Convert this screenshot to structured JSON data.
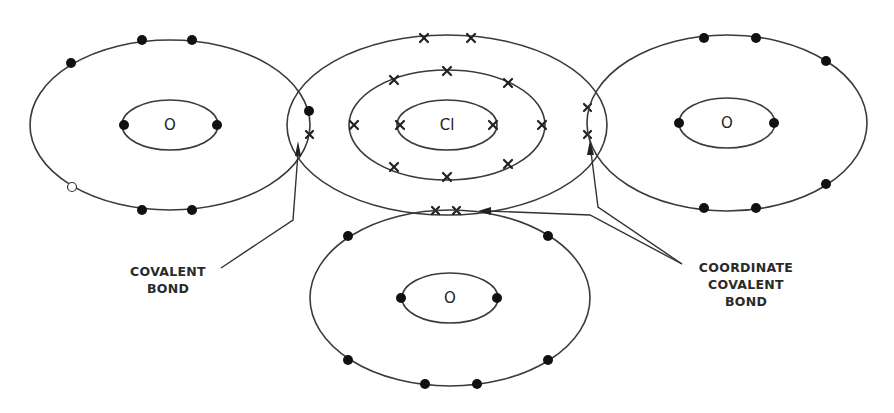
{
  "diagram": {
    "title": "",
    "atoms": [
      {
        "id": "oxygen-left",
        "symbol": "O",
        "cx": 170,
        "cy": 125,
        "shells": [
          [
            48,
            25
          ],
          [
            140,
            85
          ]
        ]
      },
      {
        "id": "chlorine",
        "symbol": "Cl",
        "cx": 447,
        "cy": 125,
        "shells": [
          [
            50,
            25
          ],
          [
            98,
            55
          ],
          [
            160,
            90
          ]
        ]
      },
      {
        "id": "oxygen-right",
        "symbol": "O",
        "cx": 727,
        "cy": 123,
        "shells": [
          [
            48,
            25
          ],
          [
            140,
            88
          ]
        ]
      },
      {
        "id": "oxygen-bottom",
        "symbol": "O",
        "cx": 450,
        "cy": 298,
        "shells": [
          [
            48,
            25
          ],
          [
            140,
            88
          ]
        ]
      }
    ],
    "electron_marks": {
      "dot": "oxygen electron (•)",
      "cross": "chlorine electron (×)",
      "hollow": "electron vacancy (○)"
    },
    "labels": {
      "covalent_line1": "COVALENT",
      "covalent_line2": "BOND",
      "coordinate_line1": "COORDINATE",
      "coordinate_line2": "COVALENT",
      "coordinate_line3": "BOND"
    }
  }
}
